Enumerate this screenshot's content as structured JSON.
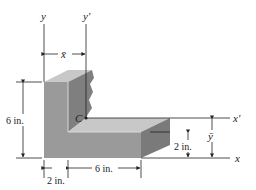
{
  "figure": {
    "type": "centroid-of-L-section",
    "axes": {
      "y": "y",
      "y_prime": "y′",
      "x": "x",
      "x_prime": "x′",
      "x_bar": "x̄",
      "y_bar": "ȳ"
    },
    "centroid_label": "C",
    "dimensions": {
      "height": "6 in.",
      "leg_width": "2 in.",
      "base_length": "6 in.",
      "base_thickness": "2 in."
    },
    "colors": {
      "front_face": "#9a9a9a",
      "top_face": "#c8c8c8",
      "side_face": "#7a7a7a",
      "inner_face": "#b4b4b4",
      "line": "#222222"
    }
  }
}
